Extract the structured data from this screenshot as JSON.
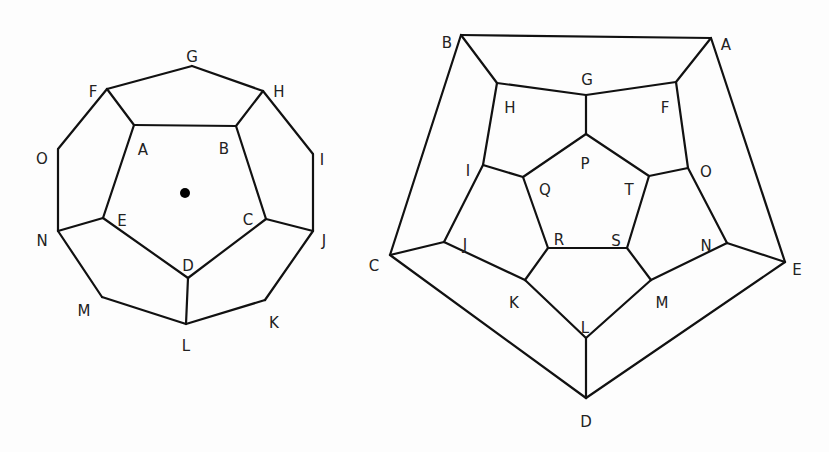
{
  "figures": [
    {
      "name": "dodecahedron-planar-view",
      "vertices": {
        "G": [
          192,
          66
        ],
        "F": [
          107,
          89
        ],
        "H": [
          263,
          91
        ],
        "A": [
          134,
          125
        ],
        "B": [
          236,
          126
        ],
        "O": [
          58,
          149
        ],
        "I": [
          313,
          154
        ],
        "E": [
          103,
          218
        ],
        "C": [
          266,
          219
        ],
        "N": [
          58,
          231
        ],
        "J": [
          313,
          231
        ],
        "D": [
          188,
          278
        ],
        "M": [
          102,
          297
        ],
        "K": [
          265,
          300
        ],
        "L": [
          186,
          324
        ]
      },
      "edges": [
        [
          "F",
          "G"
        ],
        [
          "G",
          "H"
        ],
        [
          "F",
          "A"
        ],
        [
          "H",
          "B"
        ],
        [
          "A",
          "B"
        ],
        [
          "F",
          "O"
        ],
        [
          "O",
          "N"
        ],
        [
          "H",
          "I"
        ],
        [
          "I",
          "J"
        ],
        [
          "A",
          "E"
        ],
        [
          "B",
          "C"
        ],
        [
          "E",
          "N"
        ],
        [
          "C",
          "J"
        ],
        [
          "E",
          "D"
        ],
        [
          "C",
          "D"
        ],
        [
          "D",
          "L"
        ],
        [
          "N",
          "M"
        ],
        [
          "M",
          "L"
        ],
        [
          "J",
          "K"
        ],
        [
          "K",
          "L"
        ]
      ],
      "labels": [
        {
          "text": "G",
          "x": 192,
          "y": 57
        },
        {
          "text": "F",
          "x": 93,
          "y": 92
        },
        {
          "text": "H",
          "x": 279,
          "y": 92
        },
        {
          "text": "A",
          "x": 143,
          "y": 150
        },
        {
          "text": "B",
          "x": 224,
          "y": 149
        },
        {
          "text": "O",
          "x": 42,
          "y": 159
        },
        {
          "text": "I",
          "x": 322,
          "y": 160
        },
        {
          "text": "E",
          "x": 122,
          "y": 221
        },
        {
          "text": "C",
          "x": 248,
          "y": 220
        },
        {
          "text": "N",
          "x": 42,
          "y": 241
        },
        {
          "text": "J",
          "x": 324,
          "y": 241
        },
        {
          "text": "D",
          "x": 188,
          "y": 266
        },
        {
          "text": "M",
          "x": 84,
          "y": 311
        },
        {
          "text": "K",
          "x": 274,
          "y": 323
        },
        {
          "text": "L",
          "x": 186,
          "y": 346
        }
      ],
      "center_dot": [
        185,
        193
      ]
    },
    {
      "name": "dodecahedron-schlegel-diagram",
      "vertices": {
        "B": [
          461,
          35
        ],
        "A": [
          711,
          38
        ],
        "H": [
          497,
          83
        ],
        "G": [
          586,
          95
        ],
        "F": [
          676,
          82
        ],
        "P": [
          586,
          134
        ],
        "I": [
          483,
          165
        ],
        "Q": [
          523,
          177
        ],
        "T": [
          649,
          176
        ],
        "O": [
          688,
          168
        ],
        "J": [
          444,
          242
        ],
        "R": [
          548,
          248
        ],
        "S": [
          627,
          248
        ],
        "N": [
          727,
          243
        ],
        "C": [
          390,
          255
        ],
        "E": [
          785,
          262
        ],
        "K": [
          525,
          280
        ],
        "M": [
          651,
          280
        ],
        "L": [
          586,
          338
        ],
        "D": [
          586,
          398
        ]
      },
      "edges": [
        [
          "B",
          "A"
        ],
        [
          "B",
          "C"
        ],
        [
          "A",
          "E"
        ],
        [
          "C",
          "D"
        ],
        [
          "E",
          "D"
        ],
        [
          "B",
          "H"
        ],
        [
          "A",
          "F"
        ],
        [
          "C",
          "J"
        ],
        [
          "E",
          "N"
        ],
        [
          "D",
          "L"
        ],
        [
          "H",
          "G"
        ],
        [
          "G",
          "F"
        ],
        [
          "F",
          "O"
        ],
        [
          "O",
          "N"
        ],
        [
          "N",
          "M"
        ],
        [
          "M",
          "L"
        ],
        [
          "L",
          "K"
        ],
        [
          "K",
          "J"
        ],
        [
          "J",
          "I"
        ],
        [
          "I",
          "H"
        ],
        [
          "G",
          "P"
        ],
        [
          "O",
          "T"
        ],
        [
          "M",
          "S"
        ],
        [
          "K",
          "R"
        ],
        [
          "I",
          "Q"
        ],
        [
          "P",
          "Q"
        ],
        [
          "Q",
          "R"
        ],
        [
          "R",
          "S"
        ],
        [
          "S",
          "T"
        ],
        [
          "T",
          "P"
        ]
      ],
      "labels": [
        {
          "text": "B",
          "x": 447,
          "y": 43
        },
        {
          "text": "A",
          "x": 726,
          "y": 45
        },
        {
          "text": "G",
          "x": 587,
          "y": 80
        },
        {
          "text": "H",
          "x": 510,
          "y": 108
        },
        {
          "text": "F",
          "x": 665,
          "y": 108
        },
        {
          "text": "P",
          "x": 585,
          "y": 164
        },
        {
          "text": "I",
          "x": 468,
          "y": 171
        },
        {
          "text": "O",
          "x": 706,
          "y": 172
        },
        {
          "text": "Q",
          "x": 545,
          "y": 190
        },
        {
          "text": "T",
          "x": 629,
          "y": 190
        },
        {
          "text": "J",
          "x": 465,
          "y": 245
        },
        {
          "text": "R",
          "x": 559,
          "y": 240
        },
        {
          "text": "S",
          "x": 616,
          "y": 241
        },
        {
          "text": "N",
          "x": 706,
          "y": 246
        },
        {
          "text": "C",
          "x": 374,
          "y": 266
        },
        {
          "text": "E",
          "x": 797,
          "y": 270
        },
        {
          "text": "K",
          "x": 514,
          "y": 303
        },
        {
          "text": "M",
          "x": 662,
          "y": 303
        },
        {
          "text": "L",
          "x": 585,
          "y": 328
        },
        {
          "text": "D",
          "x": 586,
          "y": 422
        }
      ]
    }
  ]
}
